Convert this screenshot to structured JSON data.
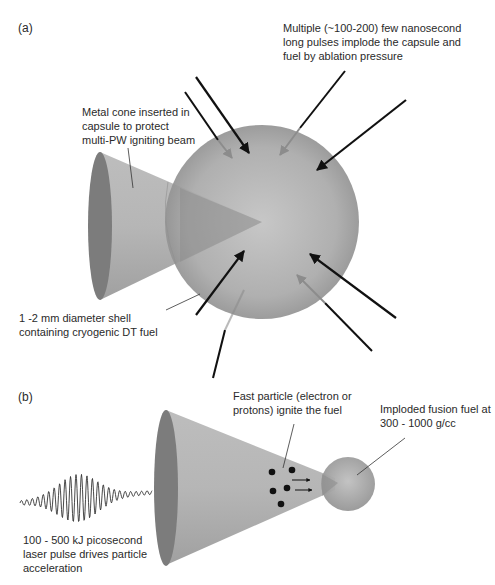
{
  "panel_a": {
    "label": "(a)",
    "annotations": {
      "pulses": [
        "Multiple (~100-200) few nanosecond",
        "long pulses implode the capsule and",
        "fuel by ablation pressure"
      ],
      "cone": [
        "Metal cone inserted in",
        "capsule to protect",
        "multi-PW igniting beam"
      ],
      "shell": [
        "1 -2 mm diameter shell",
        "containing cryogenic DT fuel"
      ]
    }
  },
  "panel_b": {
    "label": "(b)",
    "annotations": {
      "particles": [
        "Fast particle (electron or",
        "protons) ignite the fuel"
      ],
      "fuel": [
        "Imploded fusion fuel at",
        "300 - 1000 g/cc"
      ],
      "laser": [
        "100 - 500 kJ picosecond",
        "laser pulse drives particle",
        "acceleration"
      ]
    }
  },
  "colors": {
    "sphere": "#a8a8a8",
    "cone": "#b4b4b4",
    "cone_base": "#7a7a7a",
    "arrow_dark": "#111111",
    "arrow_light": "#8c8c8c"
  }
}
